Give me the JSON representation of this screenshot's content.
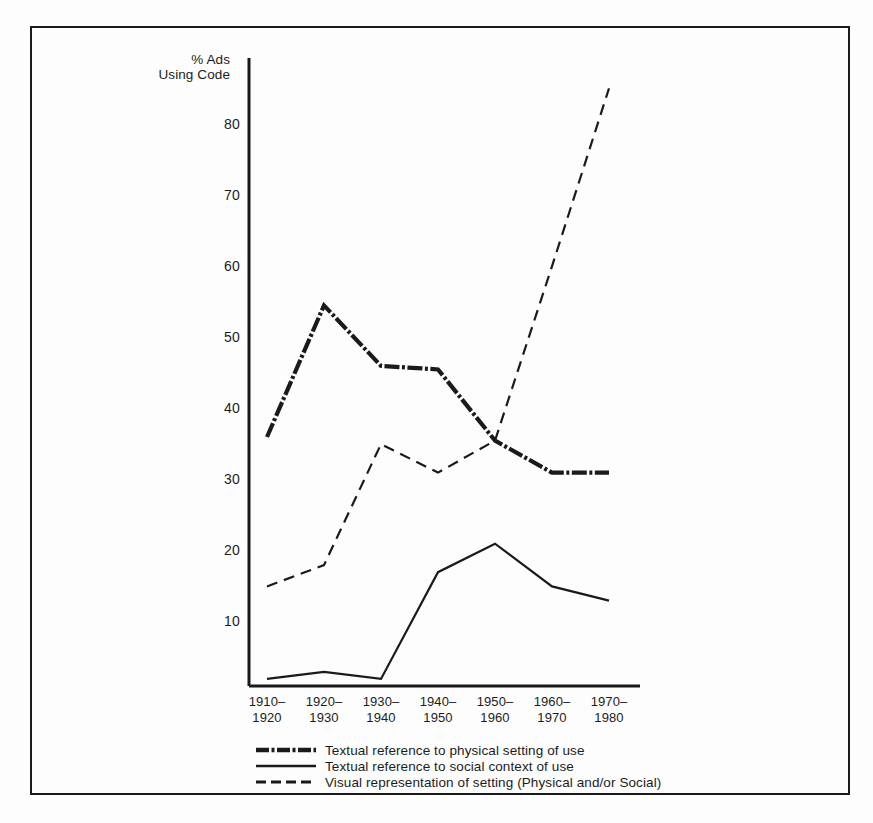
{
  "figure": {
    "y_axis_title": "% Ads\nUsing Code",
    "background_color": "#fdfdfd",
    "ink_color": "#1a1a1a"
  },
  "chart_data": {
    "type": "line",
    "title": "",
    "xlabel": "",
    "ylabel": "% Ads Using Code",
    "ylim": [
      0,
      90
    ],
    "yticks": [
      10,
      20,
      30,
      40,
      50,
      60,
      70,
      80
    ],
    "grid": false,
    "legend_position": "bottom",
    "categories": [
      "1910–\n1920",
      "1920–\n1930",
      "1930–\n1940",
      "1940–\n1950",
      "1950–\n1960",
      "1960–\n1970",
      "1970–\n1980"
    ],
    "categories_plain": [
      "1910-1920",
      "1920-1930",
      "1930-1940",
      "1940-1950",
      "1950-1960",
      "1960-1970",
      "1970-1980"
    ],
    "series": [
      {
        "name": "Textual reference to physical setting of use",
        "style": "thick-dash-dot",
        "values": [
          36,
          54.5,
          46,
          45.5,
          35.5,
          31,
          31
        ]
      },
      {
        "name": "Textual reference to social context of use",
        "style": "thin-solid",
        "values": [
          2,
          3,
          2,
          17,
          21,
          15,
          13
        ]
      },
      {
        "name": "Visual representation of setting (Physical and/or Social)",
        "style": "dashed",
        "values": [
          15,
          18,
          35,
          31,
          35.5,
          60,
          85
        ]
      }
    ]
  },
  "y_tick_labels": [
    "80",
    "70",
    "60",
    "50",
    "40",
    "30",
    "20",
    "10"
  ],
  "legend": {
    "items": [
      {
        "swatch": "thick-dash-dot-swatch",
        "label": "Textual reference to physical setting of use"
      },
      {
        "swatch": "thin-solid-swatch",
        "label": "Textual reference to social context of use"
      },
      {
        "swatch": "dashed-swatch",
        "label": "Visual representation of setting (Physical and/or Social)"
      }
    ]
  }
}
